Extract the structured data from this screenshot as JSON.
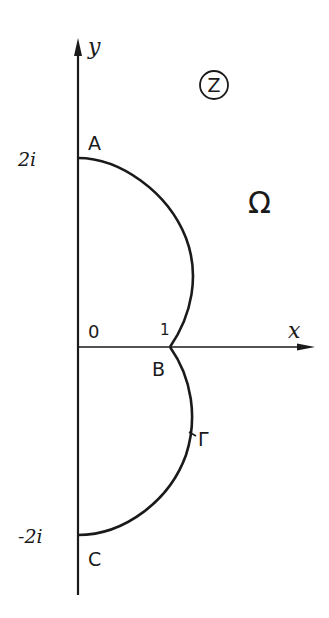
{
  "figure": {
    "type": "complex-plane contour diagram",
    "plane_label": "Z",
    "region_label": "Ω",
    "axes": {
      "x_label": "x",
      "y_label": "y",
      "origin_label": "0",
      "x_tick_label": "1",
      "y_ticks": [
        "2i",
        "-2i"
      ]
    },
    "points": [
      {
        "name": "A",
        "value": "2i"
      },
      {
        "name": "B",
        "value": "1"
      },
      {
        "name": "C",
        "value": "-2i"
      }
    ],
    "curve_label": "Γ",
    "curve_description": "Two circular arcs: upper arc from A (2i) to B (1), lower arc from B (1) to C (-2i), meeting in a cusp at B"
  },
  "colors": {
    "ink": "#1a1a1a",
    "background": "#ffffff"
  }
}
